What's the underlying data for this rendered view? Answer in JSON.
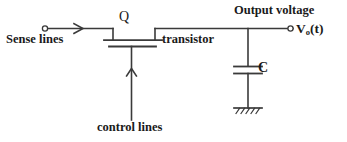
{
  "diagram": {
    "stroke_color": "#3a3a3a",
    "text_color": "#1a1a1a",
    "background": "#ffffff",
    "labels": {
      "sense_lines": "Sense lines",
      "transistor_designator": "Q",
      "transistor": "transistor",
      "control_lines": "control lines",
      "output_voltage": "Output voltage",
      "output_node_v": "V",
      "output_node_sub": "o",
      "output_node_tail": "(t)",
      "capacitor": "C"
    },
    "icons": {
      "input_terminal": "open-circle-terminal-icon",
      "output_terminal": "open-circle-terminal-icon",
      "signal_direction": "right-arrow-icon",
      "control_direction": "up-arrow-icon",
      "ground": "earth-ground-icon",
      "capacitor": "capacitor-icon",
      "transistor": "mosfet-icon"
    }
  }
}
